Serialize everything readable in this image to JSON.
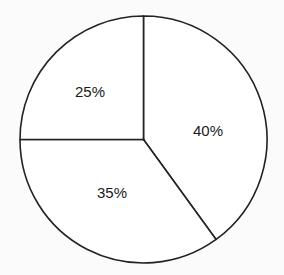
{
  "chart_data": {
    "type": "pie",
    "title": "",
    "categories": [
      "40%",
      "35%",
      "25%"
    ],
    "values": [
      40,
      35,
      25
    ],
    "labels": [
      "40%",
      "35%",
      "25%"
    ],
    "start_angle_deg": 0,
    "direction": "clockwise",
    "fill": "#ffffff",
    "stroke": "#222222",
    "legend": "none",
    "grid": false
  },
  "labels": {
    "slice_40": "40%",
    "slice_35": "35%",
    "slice_25": "25%"
  }
}
